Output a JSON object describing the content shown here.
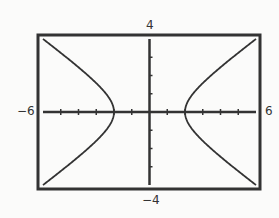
{
  "chart_data": {
    "type": "line",
    "title": "",
    "equation": "x^2/4 - y^2/2 = 1",
    "xlabel": "",
    "ylabel": "",
    "xlim": [
      -6,
      6
    ],
    "ylim": [
      -4,
      4
    ],
    "xscl": 1,
    "yscl": 1,
    "grid": false,
    "tick_labels": {
      "xmin": "−6",
      "xmax": "6",
      "ymin": "−4",
      "ymax": "4"
    },
    "series": [
      {
        "name": "right branch",
        "x": [
          6,
          5,
          4,
          3,
          2.5,
          2,
          2.5,
          3,
          4,
          5,
          6
        ],
        "y": [
          4,
          3.24,
          2.45,
          1.58,
          1.06,
          0,
          -1.06,
          -1.58,
          -2.45,
          -3.24,
          -4
        ]
      },
      {
        "name": "left branch",
        "x": [
          -6,
          -5,
          -4,
          -3,
          -2.5,
          -2,
          -2.5,
          -3,
          -4,
          -5,
          -6
        ],
        "y": [
          4,
          3.24,
          2.45,
          1.58,
          1.06,
          0,
          -1.06,
          -1.58,
          -2.45,
          -3.24,
          -4
        ]
      }
    ],
    "colors": {
      "curve": "#333333",
      "axes": "#333333",
      "frame": "#333333",
      "background": "#fbfbfa"
    }
  }
}
